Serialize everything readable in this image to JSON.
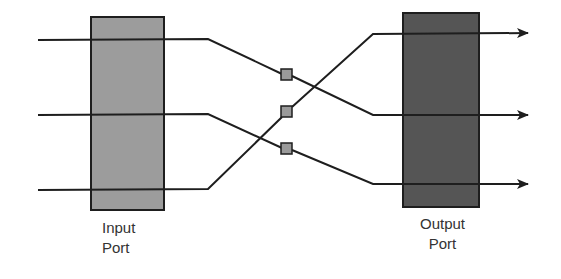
{
  "diagram": {
    "title": "",
    "colors": {
      "background": "#ffffff",
      "line": "#1e1e1e",
      "input_port_fill": "#9c9c9c",
      "output_port_fill": "#555555",
      "switch_node_fill": "#9a9a9a"
    },
    "nodes": [
      {
        "id": "input-port",
        "label_lines": [
          "Input",
          "Port"
        ],
        "shape": "rect",
        "x": 91,
        "y": 17,
        "w": 73,
        "h": 193
      },
      {
        "id": "output-port",
        "label_lines": [
          "Output",
          "Port"
        ],
        "shape": "rect",
        "x": 403,
        "y": 13,
        "w": 76,
        "h": 194
      },
      {
        "id": "switch-node-1",
        "shape": "small-square",
        "x": 281,
        "y": 69,
        "w": 11,
        "h": 11
      },
      {
        "id": "switch-node-2",
        "shape": "small-square",
        "x": 281,
        "y": 106,
        "w": 11,
        "h": 11
      },
      {
        "id": "switch-node-3",
        "shape": "small-square",
        "x": 281,
        "y": 143,
        "w": 11,
        "h": 11
      }
    ],
    "edges": [
      {
        "id": "path-top-input-to-middle-output",
        "from": "input line 1 (top)",
        "to": "output line 2 (middle)",
        "via": "switch-node-1",
        "points": [
          [
            38,
            40
          ],
          [
            208,
            39
          ],
          [
            282,
            74
          ],
          [
            292,
            75
          ],
          [
            373,
            115
          ],
          [
            528,
            115
          ]
        ]
      },
      {
        "id": "path-middle-input-to-bottom-output",
        "from": "input line 2 (middle)",
        "to": "output line 3 (bottom)",
        "via": "switch-node-3",
        "points": [
          [
            38,
            115
          ],
          [
            208,
            114
          ],
          [
            282,
            148
          ],
          [
            292,
            149
          ],
          [
            373,
            184
          ],
          [
            528,
            184
          ]
        ]
      },
      {
        "id": "path-bottom-input-to-top-output",
        "from": "input line 3 (bottom)",
        "to": "output line 1 (top)",
        "via": "switch-node-2",
        "points": [
          [
            38,
            190
          ],
          [
            208,
            189
          ],
          [
            282,
            116
          ],
          [
            292,
            107
          ],
          [
            373,
            34
          ],
          [
            528,
            33
          ]
        ]
      }
    ],
    "labels": {
      "input_port": {
        "line1": "Input",
        "line2": "Port"
      },
      "output_port": {
        "line1": "Output",
        "line2": "Port"
      }
    }
  }
}
